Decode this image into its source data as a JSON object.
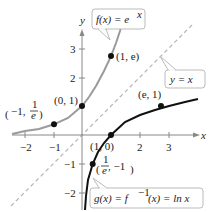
{
  "figure": {
    "axes": {
      "x_label": "x",
      "y_label": "y",
      "x_ticks": [
        "−2",
        "−1",
        "2",
        "3"
      ],
      "y_ticks": [
        "3",
        "2",
        "−1",
        "−2"
      ]
    },
    "curves": [
      {
        "name": "exp",
        "label": "f(x) = e^x",
        "color": "#9a9a9a"
      },
      {
        "name": "ln",
        "label": "g(x) = f^−1(x) = ln x",
        "color": "#111111"
      },
      {
        "name": "identity",
        "label": "y = x",
        "color": "#b5b5b5",
        "style": "dashed"
      }
    ],
    "points": [
      {
        "label": "(−1, 1/e)",
        "x": -1,
        "y": 0.3679
      },
      {
        "label": "(0, 1)",
        "x": 0,
        "y": 1
      },
      {
        "label": "(1, e)",
        "x": 1,
        "y": 2.718
      },
      {
        "label": "(e, 1)",
        "x": 2.718,
        "y": 1
      },
      {
        "label": "(1, 0)",
        "x": 1,
        "y": 0
      },
      {
        "label": "(1/e, −1)",
        "x": 0.3679,
        "y": -1
      }
    ],
    "labels": {
      "f_lhs": "f(x) = e",
      "f_sup": "x",
      "g_lhs": "g(x) = f",
      "g_sup": "−1",
      "g_rhs": "(x) = ln x",
      "yx": "y = x",
      "pt_neg1": "−1,",
      "pt_neg1_num": "1",
      "pt_neg1_den": "e",
      "pt_01": "(0, 1)",
      "pt_1e": "(1, e)",
      "pt_e1": "(e, 1)",
      "pt_10": "(1, 0)",
      "pt_inv_num": "1",
      "pt_inv_den": "e",
      "pt_inv_rest": ", −1"
    }
  }
}
